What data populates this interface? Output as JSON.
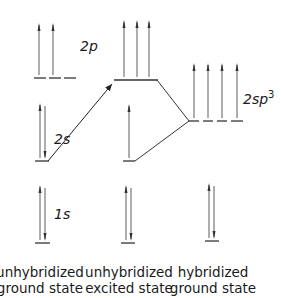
{
  "diagram": {
    "title": "",
    "orbital_labels": {
      "p2": "2p",
      "s2": "2s",
      "s1": "1s",
      "sp3_base": "2sp",
      "sp3_sup": "3"
    },
    "columns": [
      {
        "line1": "unhybridized",
        "line2": "ground state"
      },
      {
        "line1": "unhybridized",
        "line2": "excited state"
      },
      {
        "line1": "hybridized",
        "line2": "ground state"
      }
    ],
    "colors": {
      "line": "#333333",
      "arrow": "#777777"
    }
  }
}
